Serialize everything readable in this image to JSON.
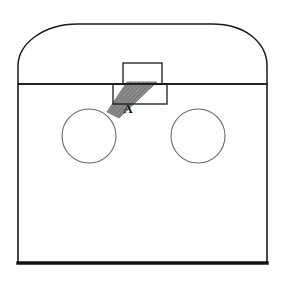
{
  "figure": {
    "background_color": "#ffffff",
    "outline_color": "#1a1a1a",
    "thin_outline_color": "#6b6b6b",
    "hatch_fill_color": "#8c8c8c",
    "hatch_line_color": "#5a5a5a",
    "labels": [
      {
        "name": "label-a",
        "text": "A",
        "x": 128,
        "y": 113,
        "font_weight": "bold",
        "font_size_px": 13,
        "color": "#141414"
      }
    ],
    "shapes": {
      "enclosure_body": {
        "name": "enclosure-body-rectangle",
        "x": 18,
        "y": 84,
        "width": 249,
        "height": 179,
        "stroke": "#1a1a1a",
        "stroke_width": 1.6
      },
      "enclosure_bottom_edge": {
        "name": "enclosure-bottom-edge",
        "x1": 18,
        "y1": 263,
        "x2": 267,
        "y2": 263,
        "stroke": "#121212",
        "stroke_width": 3.4
      },
      "dome_arch": {
        "name": "dome-arch-outline",
        "left_x": 18,
        "right_x": 267,
        "base_y": 84,
        "apex_y": 24,
        "flat_top_start_x": 78,
        "flat_top_end_x": 212,
        "stroke": "#1a1a1a",
        "stroke_width": 1.5
      },
      "left_circle": {
        "name": "left-circular-opening",
        "cx": 89,
        "cy": 136,
        "r": 27,
        "stroke": "#6b6b6b",
        "stroke_width": 1.1
      },
      "right_circle": {
        "name": "right-circular-opening",
        "cx": 198,
        "cy": 136,
        "r": 27,
        "stroke": "#6b6b6b",
        "stroke_width": 1.1
      },
      "upper_rectangle": {
        "name": "upper-detail-rectangle",
        "x": 123,
        "y": 63,
        "width": 39,
        "height": 21,
        "stroke": "#1a1a1a",
        "stroke_width": 1.3
      },
      "lower_rectangle": {
        "name": "lower-detail-rectangle",
        "x": 113,
        "y": 84,
        "width": 54,
        "height": 20,
        "stroke": "#1a1a1a",
        "stroke_width": 1.3
      },
      "hatched_plate": {
        "name": "hatched-angled-plate",
        "points": "127,82 157,82 119,118 107,112",
        "fill": "#8c8c8c",
        "stroke": "#6e6e6e",
        "stroke_width": 0.8,
        "hatch_angle_deg": 45,
        "hatch_spacing_px": 3
      }
    }
  }
}
